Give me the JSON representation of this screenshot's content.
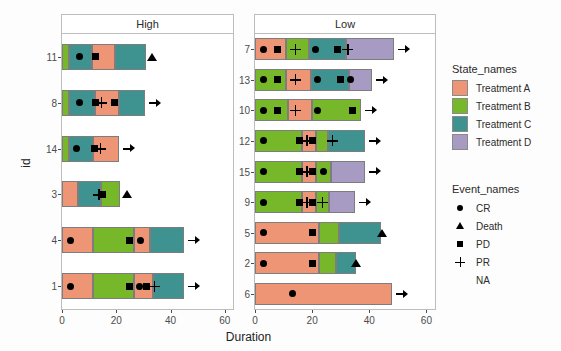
{
  "chart_data": {
    "type": "bar",
    "title": "",
    "xlabel": "Duration",
    "ylabel": "id",
    "xlim": [
      0,
      63
    ],
    "xticks": [
      0,
      20,
      40,
      60
    ],
    "xtick_labels": [
      "0",
      "20",
      "40",
      "60"
    ],
    "grid": false,
    "orientation": "horizontal",
    "stacked": true,
    "facets": [
      {
        "name": "High",
        "ytick_labels": [
          "11",
          "8",
          "14",
          "3",
          "4",
          "1"
        ],
        "rows": [
          {
            "id": "11",
            "segments": [
              {
                "state": "Treatment B",
                "start": 0,
                "end": 2.5
              },
              {
                "state": "Treatment C",
                "start": 2.5,
                "end": 11
              },
              {
                "state": "Treatment A",
                "start": 11,
                "end": 19.5
              },
              {
                "state": "Treatment C",
                "start": 19.5,
                "end": 31
              }
            ],
            "events": [
              {
                "type": "CR",
                "x": 6.5
              },
              {
                "type": "PD",
                "x": 12.5
              },
              {
                "type": "Death",
                "x": 33
              }
            ],
            "ongoing": false
          },
          {
            "id": "8",
            "segments": [
              {
                "state": "Treatment B",
                "start": 0,
                "end": 2.5
              },
              {
                "state": "Treatment C",
                "start": 2.5,
                "end": 12
              },
              {
                "state": "Treatment A",
                "start": 12,
                "end": 21
              },
              {
                "state": "Treatment C",
                "start": 21,
                "end": 30.5
              }
            ],
            "events": [
              {
                "type": "CR",
                "x": 6.5
              },
              {
                "type": "PD",
                "x": 12.5
              },
              {
                "type": "PR",
                "x": 14.5
              },
              {
                "type": "PD",
                "x": 19.5
              }
            ],
            "ongoing": true
          },
          {
            "id": "14",
            "segments": [
              {
                "state": "Treatment B",
                "start": 0,
                "end": 2.5
              },
              {
                "state": "Treatment C",
                "start": 2.5,
                "end": 11.5
              },
              {
                "state": "Treatment A",
                "start": 11.5,
                "end": 21
              }
            ],
            "events": [
              {
                "type": "CR",
                "x": 5.5
              },
              {
                "type": "PD",
                "x": 12
              },
              {
                "type": "PR",
                "x": 14
              }
            ],
            "ongoing": true
          },
          {
            "id": "3",
            "segments": [
              {
                "state": "Treatment A",
                "start": 0,
                "end": 6
              },
              {
                "state": "Treatment C",
                "start": 6,
                "end": 14.5
              },
              {
                "state": "Treatment B",
                "start": 14.5,
                "end": 21.5
              }
            ],
            "events": [
              {
                "type": "PR",
                "x": 13.5
              },
              {
                "type": "PD",
                "x": 15
              },
              {
                "type": "Death",
                "x": 24
              }
            ],
            "ongoing": false
          },
          {
            "id": "4",
            "segments": [
              {
                "state": "Treatment A",
                "start": 0,
                "end": 11.5
              },
              {
                "state": "Treatment B",
                "start": 11.5,
                "end": 26.5
              },
              {
                "state": "Treatment A",
                "start": 26.5,
                "end": 32.5
              },
              {
                "state": "Treatment C",
                "start": 32.5,
                "end": 45
              }
            ],
            "events": [
              {
                "type": "CR",
                "x": 3
              },
              {
                "type": "PD",
                "x": 25
              },
              {
                "type": "CR",
                "x": 29
              }
            ],
            "ongoing": true
          },
          {
            "id": "1",
            "segments": [
              {
                "state": "Treatment A",
                "start": 0,
                "end": 11.5
              },
              {
                "state": "Treatment B",
                "start": 11.5,
                "end": 26.5
              },
              {
                "state": "Treatment A",
                "start": 26.5,
                "end": 33.5
              },
              {
                "state": "Treatment C",
                "start": 33.5,
                "end": 45
              }
            ],
            "events": [
              {
                "type": "CR",
                "x": 3
              },
              {
                "type": "PD",
                "x": 25
              },
              {
                "type": "CR",
                "x": 28.5
              },
              {
                "type": "PD",
                "x": 31
              },
              {
                "type": "PR",
                "x": 34
              }
            ],
            "ongoing": true
          }
        ]
      },
      {
        "name": "Low",
        "ytick_labels": [
          "7",
          "13",
          "10",
          "12",
          "15",
          "9",
          "5",
          "2",
          "6"
        ],
        "rows": [
          {
            "id": "7",
            "segments": [
              {
                "state": "Treatment A",
                "start": 0,
                "end": 11
              },
              {
                "state": "Treatment B",
                "start": 11,
                "end": 19
              },
              {
                "state": "Treatment C",
                "start": 19,
                "end": 32
              },
              {
                "state": "Treatment D",
                "start": 32,
                "end": 48.5
              }
            ],
            "events": [
              {
                "type": "CR",
                "x": 3
              },
              {
                "type": "PD",
                "x": 8
              },
              {
                "type": "PR",
                "x": 14
              },
              {
                "type": "CR",
                "x": 21
              },
              {
                "type": "PD",
                "x": 29
              },
              {
                "type": "PR",
                "x": 32.5
              }
            ],
            "ongoing": true
          },
          {
            "id": "13",
            "segments": [
              {
                "state": "Treatment B",
                "start": 0,
                "end": 11
              },
              {
                "state": "Treatment A",
                "start": 11,
                "end": 19.5
              },
              {
                "state": "Treatment C",
                "start": 19.5,
                "end": 33
              },
              {
                "state": "Treatment D",
                "start": 33,
                "end": 41
              }
            ],
            "events": [
              {
                "type": "CR",
                "x": 3
              },
              {
                "type": "PD",
                "x": 8
              },
              {
                "type": "PR",
                "x": 14
              },
              {
                "type": "CR",
                "x": 22
              },
              {
                "type": "PD",
                "x": 30
              },
              {
                "type": "CR",
                "x": 33.5
              }
            ],
            "ongoing": true
          },
          {
            "id": "10",
            "segments": [
              {
                "state": "Treatment B",
                "start": 0,
                "end": 11.5
              },
              {
                "state": "Treatment A",
                "start": 11.5,
                "end": 20
              },
              {
                "state": "Treatment B",
                "start": 20,
                "end": 37
              }
            ],
            "events": [
              {
                "type": "CR",
                "x": 3
              },
              {
                "type": "PD",
                "x": 8
              },
              {
                "type": "PR",
                "x": 14
              },
              {
                "type": "CR",
                "x": 22
              },
              {
                "type": "PD",
                "x": 34
              }
            ],
            "ongoing": true
          },
          {
            "id": "12",
            "segments": [
              {
                "state": "Treatment B",
                "start": 0,
                "end": 16.5
              },
              {
                "state": "Treatment A",
                "start": 16.5,
                "end": 21.5
              },
              {
                "state": "Treatment B",
                "start": 21.5,
                "end": 25.5
              },
              {
                "state": "Treatment C",
                "start": 25.5,
                "end": 38.5
              }
            ],
            "events": [
              {
                "type": "CR",
                "x": 3
              },
              {
                "type": "PD",
                "x": 15.5
              },
              {
                "type": "PR",
                "x": 18
              },
              {
                "type": "PD",
                "x": 20
              },
              {
                "type": "PR",
                "x": 27
              }
            ],
            "ongoing": true
          },
          {
            "id": "15",
            "segments": [
              {
                "state": "Treatment B",
                "start": 0,
                "end": 16.5
              },
              {
                "state": "Treatment A",
                "start": 16.5,
                "end": 21.5
              },
              {
                "state": "Treatment B",
                "start": 21.5,
                "end": 26.5
              },
              {
                "state": "Treatment D",
                "start": 26.5,
                "end": 38.5
              }
            ],
            "events": [
              {
                "type": "CR",
                "x": 3
              },
              {
                "type": "PD",
                "x": 15.5
              },
              {
                "type": "PR",
                "x": 18
              },
              {
                "type": "PD",
                "x": 20
              },
              {
                "type": "CR",
                "x": 24
              }
            ],
            "ongoing": true
          },
          {
            "id": "9",
            "segments": [
              {
                "state": "Treatment B",
                "start": 0,
                "end": 16.5
              },
              {
                "state": "Treatment A",
                "start": 16.5,
                "end": 21.5
              },
              {
                "state": "Treatment B",
                "start": 21.5,
                "end": 26
              },
              {
                "state": "Treatment D",
                "start": 26,
                "end": 35
              }
            ],
            "events": [
              {
                "type": "CR",
                "x": 3
              },
              {
                "type": "PD",
                "x": 15.5
              },
              {
                "type": "PR",
                "x": 18
              },
              {
                "type": "PD",
                "x": 20
              },
              {
                "type": "PR",
                "x": 23.5
              }
            ],
            "ongoing": true
          },
          {
            "id": "5",
            "segments": [
              {
                "state": "Treatment A",
                "start": 0,
                "end": 22.5
              },
              {
                "state": "Treatment B",
                "start": 22.5,
                "end": 29.5
              },
              {
                "state": "Treatment C",
                "start": 29.5,
                "end": 44
              }
            ],
            "events": [
              {
                "type": "CR",
                "x": 3
              },
              {
                "type": "PD",
                "x": 20
              },
              {
                "type": "Death",
                "x": 44.5
              }
            ],
            "ongoing": false
          },
          {
            "id": "2",
            "segments": [
              {
                "state": "Treatment A",
                "start": 0,
                "end": 22.5
              },
              {
                "state": "Treatment B",
                "start": 22.5,
                "end": 28.5
              },
              {
                "state": "Treatment C",
                "start": 28.5,
                "end": 35.5
              }
            ],
            "events": [
              {
                "type": "CR",
                "x": 3
              },
              {
                "type": "PD",
                "x": 20
              },
              {
                "type": "Death",
                "x": 35.5
              }
            ],
            "ongoing": false
          },
          {
            "id": "6",
            "segments": [
              {
                "state": "Treatment A",
                "start": 0,
                "end": 48
              }
            ],
            "events": [
              {
                "type": "CR",
                "x": 13
              }
            ],
            "ongoing": true
          }
        ]
      }
    ]
  },
  "legends": {
    "state": {
      "title": "State_names",
      "items": [
        {
          "label": "Treatment A",
          "color": "#ED9575"
        },
        {
          "label": "Treatment B",
          "color": "#76B82A"
        },
        {
          "label": "Treatment C",
          "color": "#3E9390"
        },
        {
          "label": "Treatment D",
          "color": "#A79BC4"
        }
      ]
    },
    "event": {
      "title": "Event_names",
      "items": [
        {
          "label": "CR",
          "glyph": "circle-icon"
        },
        {
          "label": "Death",
          "glyph": "triangle-icon"
        },
        {
          "label": "PD",
          "glyph": "square-icon"
        },
        {
          "label": "PR",
          "glyph": "plus-icon"
        },
        {
          "label": "NA",
          "glyph": "none-icon"
        }
      ]
    }
  }
}
